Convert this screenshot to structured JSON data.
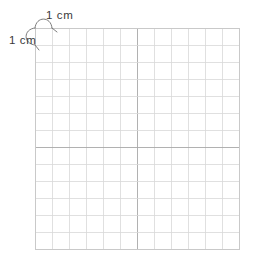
{
  "figure": {
    "background_color": "#ffffff"
  },
  "labels": {
    "horizontal": {
      "text": "1 cm",
      "describes": "width of one grid square"
    },
    "vertical": {
      "text": "1 cm",
      "describes": "height of one grid square"
    }
  },
  "grid": {
    "columns": 12,
    "rows": 13,
    "cell_size_px": 17,
    "origin_x": 35,
    "origin_y": 28,
    "line_color": "#d8d8d8",
    "accent_line_color": "#a8a8a8",
    "border_color": "#c9c9c9",
    "accent_row_index": 7,
    "accent_column_index": 6
  },
  "annotations": {
    "brace_color": "#6e6e6e",
    "brace_width": 0.9
  }
}
